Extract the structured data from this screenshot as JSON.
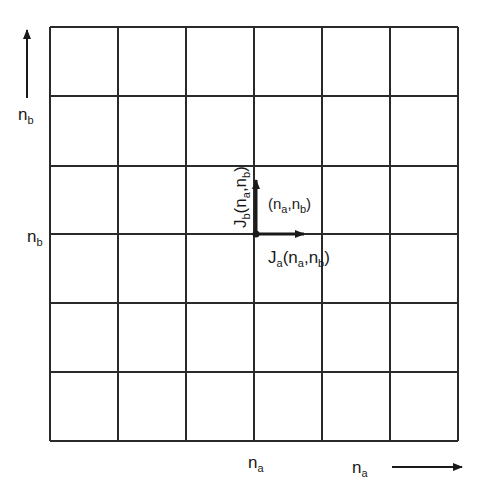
{
  "diagram": {
    "title": "",
    "grid": {
      "columns": 6,
      "rows": 6,
      "x_lines": [
        50,
        118,
        186,
        254,
        322,
        390,
        458
      ],
      "y_lines": [
        27,
        96,
        166,
        234,
        303,
        372,
        441
      ],
      "line_color": "#2a2a2a"
    },
    "axes": {
      "vertical": {
        "base": "n",
        "sub": "b",
        "direction": "up"
      },
      "horizontal": {
        "base": "n",
        "sub": "a",
        "direction": "right"
      }
    },
    "tick_labels": {
      "row_marker": {
        "base": "n",
        "sub": "b"
      },
      "column_marker": {
        "base": "n",
        "sub": "a"
      }
    },
    "node": {
      "label_open": "(",
      "a_base": "n",
      "a_sub": "a",
      "sep": ",",
      "b_base": "n",
      "b_sub": "b",
      "label_close": ")"
    },
    "vectors": {
      "Ja": {
        "base": "J",
        "sub": "a",
        "args_open": "(",
        "n1": "n",
        "n1sub": "a",
        "comma": ",",
        "n2": "n",
        "n2sub": "b",
        "args_close": ")"
      },
      "Jb": {
        "base": "J",
        "sub": "b",
        "args_open": "(",
        "n1": "n",
        "n1sub": "a",
        "comma": ",",
        "n2": "n",
        "n2sub": "b",
        "args_close": ")"
      }
    }
  }
}
